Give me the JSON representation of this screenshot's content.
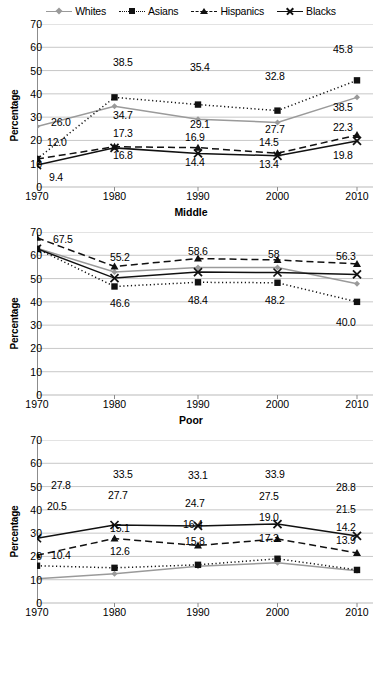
{
  "legend": {
    "items": [
      {
        "label": "Whites",
        "key": "whites",
        "marker": "diamond",
        "line": "solid-gray"
      },
      {
        "label": "Asians",
        "key": "asians",
        "marker": "square",
        "line": "dotted-black"
      },
      {
        "label": "Hispanics",
        "key": "hispanics",
        "marker": "triangle",
        "line": "dashed-black"
      },
      {
        "label": "Blacks",
        "key": "blacks",
        "marker": "x",
        "line": "solid-black"
      }
    ]
  },
  "axis": {
    "ylabel": "Percentage",
    "yticks": [
      "70",
      "60",
      "50",
      "40",
      "30",
      "20",
      "10",
      "0"
    ],
    "xticks": [
      "1970",
      "1980",
      "1990",
      "2000",
      "2010"
    ]
  },
  "panels": {
    "middle": {
      "title": "Middle"
    },
    "poor": {
      "title": "Poor"
    },
    "third": {
      "title": ""
    }
  },
  "colors": {
    "whites": "#9a9a9a",
    "asians": "#111111",
    "hispanics": "#111111",
    "blacks": "#111111",
    "grid": "#b9b9b9",
    "axis": "#8c8c8c"
  },
  "chart_data": [
    {
      "type": "line",
      "title": "Middle",
      "xlabel": "Middle",
      "ylabel": "Percentage",
      "ylim": [
        0,
        70
      ],
      "grid": true,
      "legend_position": "top-center",
      "x": [
        "1970",
        "1980",
        "1990",
        "2000",
        "2010"
      ],
      "series": [
        {
          "name": "Whites",
          "values": [
            26.0,
            34.7,
            29.1,
            27.7,
            38.5
          ],
          "labels": [
            "26.0",
            "34.7",
            "29.1",
            "27.7",
            "38.5"
          ]
        },
        {
          "name": "Asians",
          "values": [
            12.0,
            38.5,
            35.4,
            32.8,
            45.8
          ],
          "labels": [
            "",
            "38.5",
            "35.4",
            "32.8",
            "45.8"
          ]
        },
        {
          "name": "Hispanics",
          "values": [
            12.0,
            17.3,
            16.9,
            14.5,
            22.3
          ],
          "labels": [
            "12.0",
            "17.3",
            "16.9",
            "14.5",
            "22.3"
          ]
        },
        {
          "name": "Blacks",
          "values": [
            9.4,
            16.8,
            14.4,
            13.4,
            19.8
          ],
          "labels": [
            "9.4",
            "16.8",
            "14.4",
            "13.4",
            "19.8"
          ]
        }
      ]
    },
    {
      "type": "line",
      "title": "Poor",
      "xlabel": "Poor",
      "ylabel": "Percentage",
      "ylim": [
        0,
        70
      ],
      "grid": true,
      "legend_position": "top-center",
      "x": [
        "1970",
        "1980",
        "1990",
        "2000",
        "2010"
      ],
      "series": [
        {
          "name": "Whites",
          "values": [
            63.0,
            52.8,
            54.8,
            54.8,
            47.8
          ],
          "labels": [
            "",
            "",
            "",
            "",
            ""
          ]
        },
        {
          "name": "Asians",
          "values": [
            62.8,
            46.6,
            48.4,
            48.2,
            40.0
          ],
          "labels": [
            "",
            "46.6",
            "48.4",
            "48.2",
            "40.0"
          ]
        },
        {
          "name": "Hispanics",
          "values": [
            67.5,
            55.2,
            58.6,
            58.0,
            56.3
          ],
          "labels": [
            "67.5",
            "55.2",
            "58.6",
            "58",
            "56.3"
          ]
        },
        {
          "name": "Blacks",
          "values": [
            62.8,
            50.2,
            52.8,
            52.6,
            51.8
          ],
          "labels": [
            "",
            "",
            "",
            "",
            ""
          ]
        }
      ]
    },
    {
      "type": "line",
      "title": "",
      "xlabel": "",
      "ylabel": "Percentage",
      "ylim": [
        0,
        70
      ],
      "grid": true,
      "legend_position": "top-center",
      "x": [
        "1970",
        "1980",
        "1990",
        "2000",
        "2010"
      ],
      "series": [
        {
          "name": "Whites",
          "values": [
            10.4,
            12.6,
            15.8,
            17.3,
            13.9
          ],
          "labels": [
            "10.4",
            "12.6",
            "15.8",
            "17.3",
            "13.9"
          ]
        },
        {
          "name": "Asians",
          "values": [
            16.0,
            15.1,
            16.4,
            19.0,
            14.2
          ],
          "labels": [
            "",
            "15.1",
            "16.4",
            "19.0",
            "14.2"
          ]
        },
        {
          "name": "Hispanics",
          "values": [
            20.5,
            27.7,
            24.7,
            27.5,
            21.5
          ],
          "labels": [
            "20.5",
            "27.7",
            "24.7",
            "27.5",
            "21.5"
          ]
        },
        {
          "name": "Blacks",
          "values": [
            27.8,
            33.5,
            33.1,
            33.9,
            28.8
          ],
          "labels": [
            "27.8",
            "33.5",
            "33.1",
            "33.9",
            "28.8"
          ]
        }
      ]
    }
  ],
  "data_labels": {
    "middle": [
      {
        "text": "26.0",
        "x": 14,
        "y": 93
      },
      {
        "text": "34.7",
        "x": 76,
        "y": 86
      },
      {
        "text": "29.1",
        "x": 153,
        "y": 95
      },
      {
        "text": "27.7",
        "x": 228,
        "y": 100
      },
      {
        "text": "38.5",
        "x": 296,
        "y": 78
      },
      {
        "text": "38.5",
        "x": 76,
        "y": 33
      },
      {
        "text": "35.4",
        "x": 153,
        "y": 38
      },
      {
        "text": "32.8",
        "x": 228,
        "y": 47
      },
      {
        "text": "45.8",
        "x": 296,
        "y": 20
      },
      {
        "text": "12.0",
        "x": 10,
        "y": 113
      },
      {
        "text": "17.3",
        "x": 76,
        "y": 104
      },
      {
        "text": "16.9",
        "x": 148,
        "y": 108
      },
      {
        "text": "14.5",
        "x": 222,
        "y": 113
      },
      {
        "text": "22.3",
        "x": 296,
        "y": 98
      },
      {
        "text": "9.4",
        "x": 12,
        "y": 148
      },
      {
        "text": "16.8",
        "x": 76,
        "y": 126
      },
      {
        "text": "14.4",
        "x": 148,
        "y": 133
      },
      {
        "text": "13.4",
        "x": 222,
        "y": 135
      },
      {
        "text": "19.8",
        "x": 296,
        "y": 126
      }
    ],
    "poor": [
      {
        "text": "67.5",
        "x": 16,
        "y": 2
      },
      {
        "text": "55.2",
        "x": 73,
        "y": 20
      },
      {
        "text": "58.6",
        "x": 151,
        "y": 14
      },
      {
        "text": "58",
        "x": 231,
        "y": 17
      },
      {
        "text": "56.3",
        "x": 299,
        "y": 19
      },
      {
        "text": "46.6",
        "x": 73,
        "y": 66
      },
      {
        "text": "48.4",
        "x": 151,
        "y": 63
      },
      {
        "text": "48.2",
        "x": 228,
        "y": 63
      },
      {
        "text": "40.0",
        "x": 299,
        "y": 85
      }
    ],
    "third": [
      {
        "text": "27.8",
        "x": 14,
        "y": 40
      },
      {
        "text": "33.5",
        "x": 76,
        "y": 29
      },
      {
        "text": "33.1",
        "x": 151,
        "y": 30
      },
      {
        "text": "33.9",
        "x": 228,
        "y": 29
      },
      {
        "text": "28.8",
        "x": 299,
        "y": 42
      },
      {
        "text": "20.5",
        "x": 10,
        "y": 61
      },
      {
        "text": "27.7",
        "x": 71,
        "y": 50
      },
      {
        "text": "24.7",
        "x": 148,
        "y": 58
      },
      {
        "text": "27.5",
        "x": 222,
        "y": 51
      },
      {
        "text": "21.5",
        "x": 299,
        "y": 64
      },
      {
        "text": "15.1",
        "x": 73,
        "y": 83
      },
      {
        "text": "16.4",
        "x": 146,
        "y": 79
      },
      {
        "text": "19.0",
        "x": 222,
        "y": 72
      },
      {
        "text": "14.2",
        "x": 299,
        "y": 82
      },
      {
        "text": "10.4",
        "x": 14,
        "y": 110
      },
      {
        "text": "12.6",
        "x": 73,
        "y": 106
      },
      {
        "text": "15.8",
        "x": 148,
        "y": 96
      },
      {
        "text": "17.3",
        "x": 222,
        "y": 93
      },
      {
        "text": "13.9",
        "x": 299,
        "y": 95
      }
    ]
  }
}
